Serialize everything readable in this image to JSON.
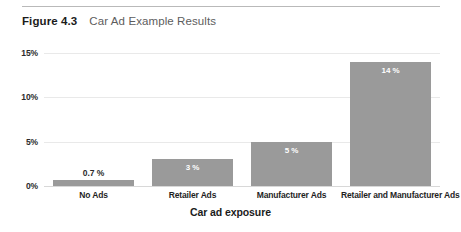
{
  "figure": {
    "label": "Figure 4.3",
    "title": "Car Ad Example Results"
  },
  "chart_data": {
    "type": "bar",
    "title": "Car Ad Example Results",
    "xlabel": "Car ad exposure",
    "ylabel": "",
    "categories": [
      "No Ads",
      "Retailer Ads",
      "Manufacturer Ads",
      "Retailer and Manufacturer Ads"
    ],
    "values": [
      0.7,
      3,
      5,
      14
    ],
    "value_labels": [
      "0.7 %",
      "3 %",
      "5 %",
      "14 %"
    ],
    "ylim": [
      0,
      15
    ],
    "yticks": [
      0,
      5,
      10,
      15
    ],
    "ytick_labels": [
      "0%",
      "5%",
      "10%",
      "15%"
    ],
    "grid": true,
    "legend": "none",
    "bar_color": "#9a9a9a",
    "gridline_color": "#e9e9e9",
    "label_inside_flags": [
      false,
      true,
      true,
      true
    ]
  }
}
